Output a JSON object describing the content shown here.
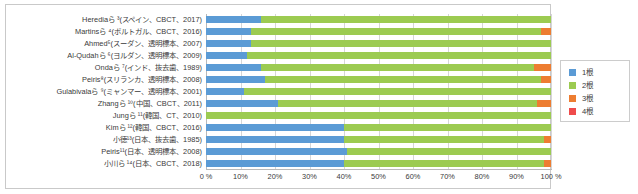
{
  "chart_data": {
    "type": "bar",
    "orientation": "horizontal",
    "stacked": true,
    "title": "",
    "xlabel": "",
    "ylabel": "",
    "xlim": [
      0,
      100
    ],
    "xtick_labels": [
      "0 %",
      "10%",
      "20%",
      "30%",
      "40%",
      "50%",
      "60%",
      "70%",
      "80%",
      "90%",
      "100 %"
    ],
    "xticks": [
      0,
      10,
      20,
      30,
      40,
      50,
      60,
      70,
      80,
      90,
      100
    ],
    "grid": true,
    "legend_position": "right-outside",
    "series": [
      {
        "name": "1根",
        "color": "#5b9bd5",
        "values": [
          16,
          13,
          13,
          12,
          16,
          17,
          11,
          21,
          0,
          40,
          40,
          41,
          40
        ]
      },
      {
        "name": "2根",
        "color": "#9ccb51",
        "values": [
          84,
          84,
          87,
          88,
          79,
          80,
          89,
          75,
          100,
          60,
          58,
          59,
          58
        ]
      },
      {
        "name": "3根",
        "color": "#ed7d31",
        "values": [
          0,
          3,
          0,
          0,
          5,
          3,
          0,
          4,
          0,
          0,
          2,
          0,
          2
        ]
      },
      {
        "name": "4根",
        "color": "#ef4b4b",
        "values": [
          0,
          0,
          0,
          0,
          0,
          0,
          0,
          0,
          0,
          0,
          0,
          0,
          0
        ]
      }
    ],
    "categories": [
      "Herediaら ³(スペイン、CBCT、2017)",
      "Martinsら ⁴(ポルトガル、CBCT、2016)",
      "Ahmed⁵(スーダン、透明標本、2007)",
      "Al-Qudahら ⁶(ヨルダン、透明標本、2009)",
      "Ondaら ⁷(インド、抜去歯、1989)",
      "Peiris⁸(スリランカ、透明標本、2008)",
      "Gulabivalaら ⁹(ミャンマー、透明標本、2001)",
      "Zhangら ¹⁰(中国、CBCT、2011)",
      "Jungら ¹¹(韓国、CT、2010)",
      "Kimら ¹²(韓国、CBCT、2016)",
      "小徳¹³(日本、抜去歯、1985)",
      "Peiris¹¹(日本、透明標本、2008)",
      "小川ら ¹⁴(日本、CBCT、2018)"
    ]
  },
  "legend": {
    "items": [
      {
        "label": "1根",
        "color": "#5b9bd5"
      },
      {
        "label": "2根",
        "color": "#9ccb51"
      },
      {
        "label": "3根",
        "color": "#ed7d31"
      },
      {
        "label": "4根",
        "color": "#ef4b4b"
      }
    ]
  }
}
